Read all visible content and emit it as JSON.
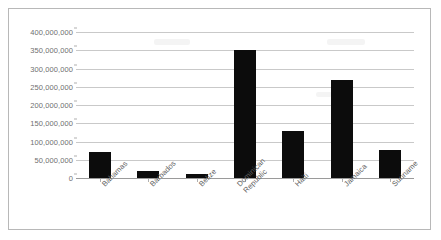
{
  "chart_data": {
    "type": "bar",
    "title": "",
    "subtitle": "",
    "xlabel": "",
    "ylabel": "",
    "categories": [
      "Bahamas",
      "Barbados",
      "Belize",
      "Dominican Republic",
      "Haiti",
      "Jamaica",
      "Suriname"
    ],
    "category_lines": [
      [
        "Bahamas"
      ],
      [
        "Barbados"
      ],
      [
        "Belize"
      ],
      [
        "Dominican",
        "Republic"
      ],
      [
        "Haiti"
      ],
      [
        "Jamaica"
      ],
      [
        "Suriname"
      ]
    ],
    "values": [
      70000000,
      20000000,
      10000000,
      350000000,
      128000000,
      268000000,
      78000000
    ],
    "ylim": [
      0,
      400000000
    ],
    "ytick_step": 50000000,
    "ytick_labels": [
      "400,000,000",
      "350,000,000",
      "300,000,000",
      "250,000,000",
      "200,000,000",
      "150,000,000",
      "100,000,000",
      "50,000,000",
      "0"
    ],
    "ytick_values": [
      400000000,
      350000000,
      300000000,
      250000000,
      200000000,
      150000000,
      100000000,
      50000000,
      0
    ],
    "grid": true,
    "legend": false,
    "legend_position": "none",
    "series": [
      {
        "name": "",
        "values": [
          70000000,
          20000000,
          10000000,
          350000000,
          128000000,
          268000000,
          78000000
        ]
      }
    ]
  },
  "style": {
    "bar_color": "#0c0c0c",
    "gridline_color": "#c9c9c9",
    "baseline_color": "#9a9a9a",
    "frame_color": "#b8b8b8",
    "background_color": "#ffffff",
    "tick_label_color": "#6f6f6f"
  }
}
